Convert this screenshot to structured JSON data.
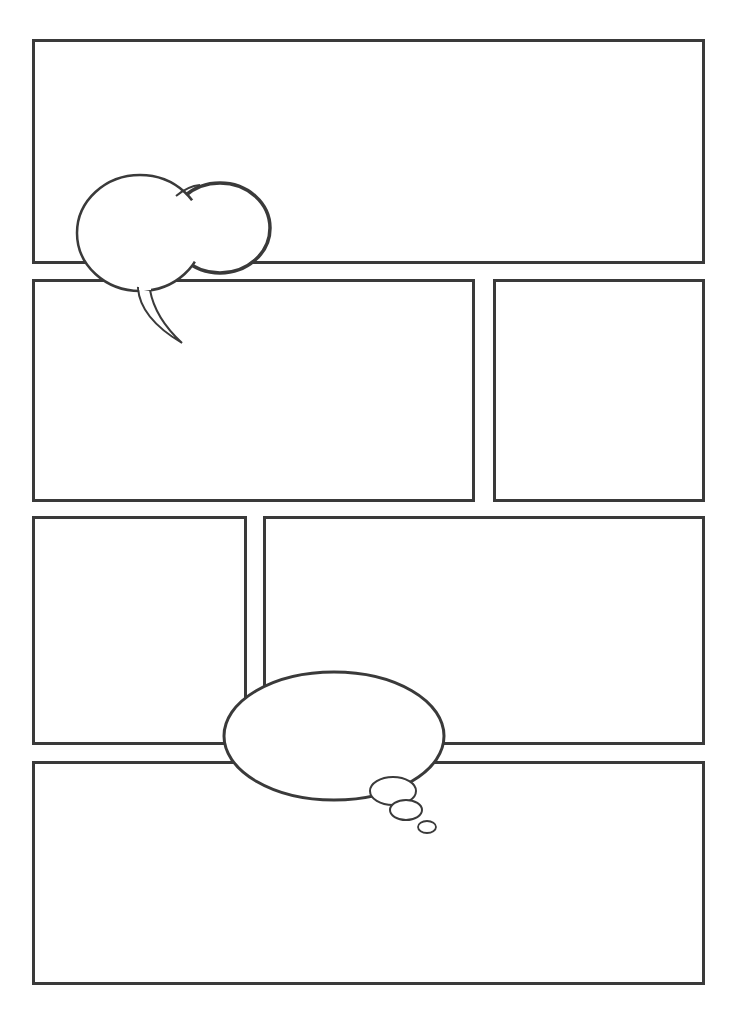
{
  "page": {
    "type": "blank comic page template",
    "background": "#ffffff",
    "border_color": "#3a3a3a"
  },
  "panels": [
    {
      "id": "panel-1",
      "row": 1,
      "x": 32,
      "y": 39,
      "w": 673,
      "h": 225
    },
    {
      "id": "panel-2",
      "row": 2,
      "x": 32,
      "y": 279,
      "w": 443,
      "h": 223
    },
    {
      "id": "panel-3",
      "row": 2,
      "x": 493,
      "y": 279,
      "w": 212,
      "h": 223
    },
    {
      "id": "panel-4",
      "row": 3,
      "x": 32,
      "y": 516,
      "w": 215,
      "h": 229
    },
    {
      "id": "panel-5",
      "row": 3,
      "x": 263,
      "y": 516,
      "w": 442,
      "h": 229
    },
    {
      "id": "panel-6",
      "row": 4,
      "x": 32,
      "y": 761,
      "w": 673,
      "h": 224
    }
  ],
  "bubbles": [
    {
      "id": "speech-bubble",
      "kind": "cloud speech bubble with tail",
      "text": ""
    },
    {
      "id": "thought-bubble",
      "kind": "oval thought bubble with trailing circles",
      "text": ""
    }
  ]
}
